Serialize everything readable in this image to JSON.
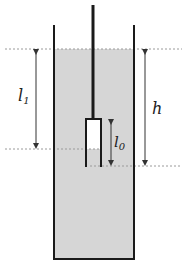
{
  "diagram": {
    "labels": {
      "l1": "l",
      "l1_sub": "1",
      "h": "h",
      "l0": "l",
      "l0_sub": "0"
    },
    "colors": {
      "water": "#d6d6d6",
      "wall": "#1a1a1a",
      "arrow": "#333333",
      "dotted_line": "#9a9a9a",
      "background": "#ffffff"
    }
  }
}
